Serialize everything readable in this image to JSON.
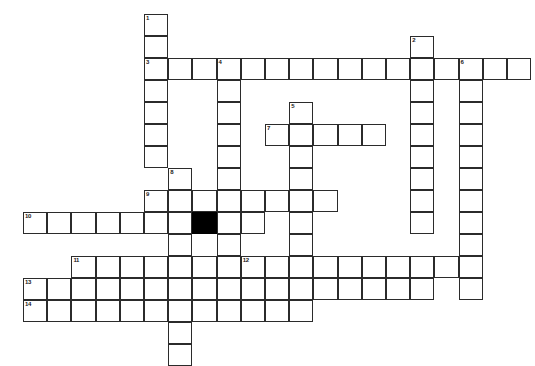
{
  "puzzle": {
    "title": "Crossword Puzzle Grid",
    "type": "crossword-grid",
    "grid": {
      "origin_x": 23,
      "origin_y": 14,
      "cell_w": 24.2,
      "cell_h": 22,
      "cols": 21,
      "rows": 15,
      "line_color": "#2b2b2b",
      "cell_fill": "#ffffff",
      "blocked_fill": "#000000",
      "page_background": "#ffffff"
    },
    "blocked_cells": [
      {
        "col": 7,
        "row": 9
      }
    ],
    "entries": [
      {
        "number": "1",
        "direction": "down",
        "col": 5,
        "row": 0,
        "length": 7
      },
      {
        "number": "2",
        "direction": "down",
        "col": 16,
        "row": 1,
        "length": 9
      },
      {
        "number": "3",
        "direction": "across",
        "col": 5,
        "row": 2,
        "length": 12
      },
      {
        "number": "4",
        "direction": "down",
        "col": 8,
        "row": 2,
        "length": 11
      },
      {
        "number": "6",
        "direction": "down",
        "col": 18,
        "row": 2,
        "length": 11
      },
      {
        "number": "5",
        "direction": "down",
        "col": 11,
        "row": 4,
        "length": 9
      },
      {
        "number": "7",
        "direction": "across",
        "col": 10,
        "row": 5,
        "length": 5
      },
      {
        "number": "8",
        "direction": "down",
        "col": 6,
        "row": 7,
        "length": 9
      },
      {
        "number": "9",
        "direction": "across",
        "col": 5,
        "row": 8,
        "length": 7
      },
      {
        "number": "10",
        "direction": "across",
        "col": 0,
        "row": 9,
        "length": 9
      },
      {
        "number": "11",
        "direction": "across",
        "col": 2,
        "row": 11,
        "length": 7
      },
      {
        "number": "12",
        "direction": "across",
        "col": 9,
        "row": 11,
        "length": 9
      },
      {
        "number": "13",
        "direction": "across",
        "col": 0,
        "row": 12,
        "length": 17
      },
      {
        "number": "14",
        "direction": "across",
        "col": 0,
        "row": 13,
        "length": 12
      }
    ],
    "extra_cells": [
      {
        "col": 17,
        "row": 2
      },
      {
        "col": 19,
        "row": 2
      },
      {
        "col": 20,
        "row": 2
      },
      {
        "col": 12,
        "row": 8
      },
      {
        "col": 8,
        "row": 9
      },
      {
        "col": 9,
        "row": 9
      }
    ],
    "numbers": [
      "1",
      "2",
      "3",
      "4",
      "5",
      "6",
      "7",
      "8",
      "9",
      "10",
      "11",
      "12",
      "13",
      "14"
    ],
    "letters": []
  }
}
